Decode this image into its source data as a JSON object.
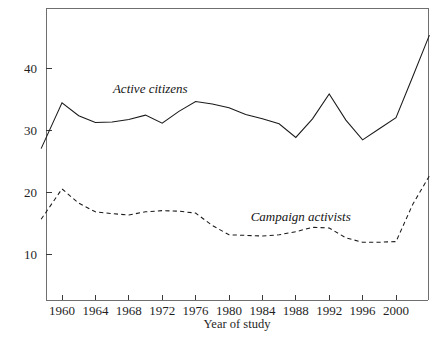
{
  "chart_data": {
    "type": "line",
    "title": "",
    "xlabel": "Year of study",
    "ylabel": "",
    "xlim": [
      1957,
      2004
    ],
    "ylim": [
      0,
      48
    ],
    "grid": false,
    "legend_position": "inline-annotation",
    "xticks": [
      1960,
      1964,
      1968,
      1972,
      1976,
      1980,
      1984,
      1988,
      1992,
      1996,
      2000
    ],
    "xtick_labels": [
      "1960",
      "1964",
      "1968",
      "1972",
      "1976",
      "1980",
      "1984",
      "1988",
      "1992",
      "1996",
      "2000"
    ],
    "yticks": [
      10,
      20,
      30,
      40
    ],
    "ytick_labels": [
      "10",
      "20",
      "30",
      "40"
    ],
    "series": [
      {
        "name": "Active citizens",
        "style": "solid",
        "color": "#1a1a1a",
        "x": [
          1957.5,
          1960,
          1962,
          1964,
          1966,
          1968,
          1970,
          1972,
          1974,
          1976,
          1978,
          1980,
          1982,
          1984,
          1986,
          1988,
          1990,
          1992,
          1994,
          1996,
          1998,
          2000,
          2002,
          2004
        ],
        "values": [
          27.0,
          34.4,
          32.3,
          31.2,
          31.3,
          31.7,
          32.4,
          31.1,
          33.0,
          34.6,
          34.2,
          33.6,
          32.5,
          31.8,
          31.0,
          28.8,
          31.8,
          35.8,
          31.6,
          28.4,
          30.2,
          32.0,
          38.6,
          45.3
        ]
      },
      {
        "name": "Campaign activists",
        "style": "dashed",
        "color": "#1a1a1a",
        "x": [
          1957.5,
          1960,
          1962,
          1964,
          1966,
          1968,
          1970,
          1972,
          1974,
          1976,
          1978,
          1980,
          1982,
          1984,
          1986,
          1988,
          1990,
          1992,
          1994,
          1996,
          1998,
          2000,
          2002,
          2004
        ],
        "values": [
          15.6,
          20.5,
          18.2,
          16.8,
          16.5,
          16.3,
          16.8,
          17.0,
          16.9,
          16.6,
          14.6,
          13.1,
          13.0,
          12.9,
          13.1,
          13.6,
          14.3,
          14.2,
          12.6,
          11.9,
          11.9,
          12.0,
          18.0,
          22.6
        ]
      }
    ],
    "annotations": [
      {
        "text": "Active citizens",
        "x": 1966.1,
        "y": 35.9,
        "style": "italic"
      },
      {
        "text": "Campaign activists",
        "x": 1982.6,
        "y": 15.4,
        "style": "italic"
      }
    ]
  },
  "axis": {
    "x_title": "Year of study"
  },
  "geometry": {
    "plot_left": 46,
    "plot_right": 428,
    "plot_top": 8,
    "plot_bottom": 300
  }
}
